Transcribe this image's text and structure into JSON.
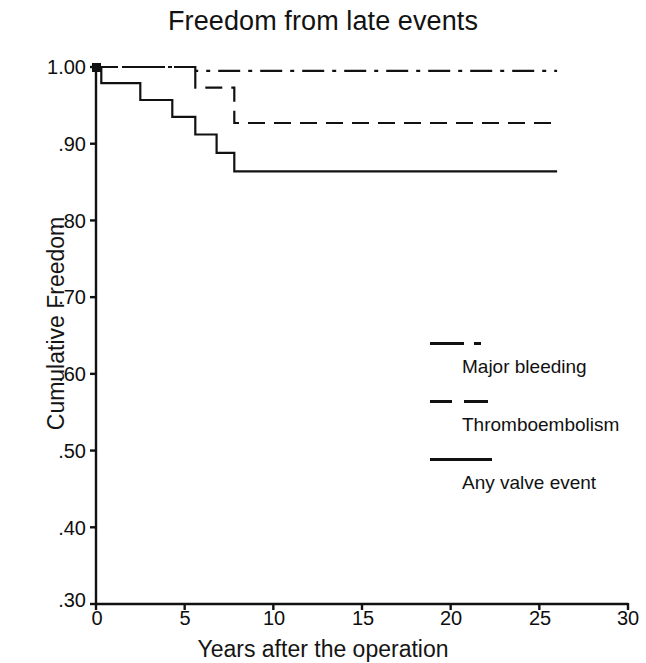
{
  "chart_data": {
    "type": "line",
    "subtype": "kaplan-meier-step",
    "title": "Freedom from late events",
    "xlabel": "Years after the operation",
    "ylabel": "Cumulative Freedom",
    "xlim": [
      0,
      30
    ],
    "ylim": [
      0.3,
      1.0
    ],
    "xticks": [
      0,
      5,
      10,
      15,
      20,
      25,
      30
    ],
    "xtick_labels": [
      "0",
      "5",
      "10",
      "15",
      "20",
      "25",
      "30"
    ],
    "yticks": [
      1.0,
      0.9,
      0.8,
      0.7,
      0.6,
      0.5,
      0.4,
      0.3
    ],
    "ytick_labels": [
      "1.00",
      ".90",
      ".80",
      ".70",
      ".60",
      ".50",
      ".40",
      ".30"
    ],
    "grid": false,
    "legend_position": "center-right",
    "series": [
      {
        "name": "Major bleeding",
        "linestyle": "dash-dot",
        "color": "#111111",
        "x": [
          0,
          5.6,
          26.0
        ],
        "y": [
          1.0,
          0.995,
          0.995
        ]
      },
      {
        "name": "Thromboembolism",
        "linestyle": "dashed",
        "color": "#111111",
        "x": [
          0,
          5.6,
          7.8,
          26.0
        ],
        "y": [
          1.0,
          0.973,
          0.927,
          0.927
        ]
      },
      {
        "name": "Any valve event",
        "linestyle": "solid",
        "color": "#111111",
        "x": [
          0,
          0.3,
          2.5,
          4.3,
          5.6,
          6.8,
          7.8,
          26.0
        ],
        "y": [
          1.0,
          0.979,
          0.957,
          0.935,
          0.912,
          0.888,
          0.864,
          0.864
        ]
      }
    ]
  },
  "title": {
    "text": "Freedom from late events"
  },
  "axes": {
    "y_title": "Cumulative Freedom",
    "x_title": "Years after the operation",
    "y_ticks": [
      {
        "label": "1.00",
        "value": 1.0
      },
      {
        "label": ".90",
        "value": 0.9
      },
      {
        "label": ".80",
        "value": 0.8
      },
      {
        "label": ".70",
        "value": 0.7
      },
      {
        "label": ".60",
        "value": 0.6
      },
      {
        "label": ".50",
        "value": 0.5
      },
      {
        "label": ".40",
        "value": 0.4
      },
      {
        "label": ".30",
        "value": 0.3
      }
    ],
    "x_ticks": [
      {
        "label": "0",
        "value": 0
      },
      {
        "label": "5",
        "value": 5
      },
      {
        "label": "10",
        "value": 10
      },
      {
        "label": "15",
        "value": 15
      },
      {
        "label": "20",
        "value": 20
      },
      {
        "label": "25",
        "value": 25
      },
      {
        "label": "30",
        "value": 30
      }
    ]
  },
  "legend": {
    "entries": [
      {
        "label": "Major bleeding",
        "style": "dash-dot"
      },
      {
        "label": "Thromboembolism",
        "style": "dashed"
      },
      {
        "label": "Any valve event",
        "style": "solid"
      }
    ]
  },
  "style": {
    "ink": "#111111",
    "paper": "#ffffff"
  }
}
